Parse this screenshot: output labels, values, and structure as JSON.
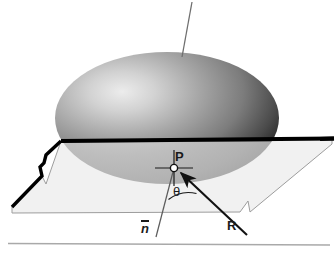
{
  "figure": {
    "background_color": "#ffffff",
    "width": 335,
    "height": 253
  },
  "labels": {
    "point_P": "P",
    "angle_theta": "θ",
    "vector_R": "R",
    "vector_n": "n"
  },
  "colors": {
    "sphere_highlight": "#e8e8e8",
    "sphere_mid": "#8f8f8f",
    "sphere_dark": "#1e1e1e",
    "sphere_below_plane": "#b4b4b4",
    "plane_fill": "#f0f0f0",
    "plane_outline": "#9a9a9a",
    "edge_thick": "#000000",
    "line_thin": "#6e6e6e",
    "rule_line": "#a8a8a8",
    "label_color": "#1a1a1a"
  },
  "geometry": {
    "sphere": {
      "center_x": 167,
      "center_y": 118,
      "radius_x": 112,
      "radius_y": 66,
      "highlight_x": 118,
      "highlight_y": 92
    },
    "plane": {
      "points": "61,141 332,139 332,144 250,212 248,201 240,212 12,213 12,206 42,176 46,184"
    },
    "intersection_edge": {
      "from_x": 61,
      "from_y": 141,
      "to_x": 334,
      "to_y": 139
    },
    "point_P": {
      "x": 174,
      "y": 168,
      "radius": 3.6
    },
    "normal_vector": {
      "from_x": 174,
      "from_y": 168,
      "to_x": 156,
      "to_y": 238
    },
    "reflection_vector": {
      "from_x": 246,
      "from_y": 234,
      "to_x": 180,
      "to_y": 172
    },
    "upper_thin_line": {
      "from_x": 192,
      "from_y": 2,
      "to_x": 182,
      "to_y": 57
    },
    "angle_arc": {
      "cx": 174,
      "cy": 168,
      "radius": 33,
      "start_deg": 75,
      "end_deg": 43
    },
    "bottom_rule": {
      "x1": 8,
      "y1": 243,
      "x2": 330,
      "y2": 245
    }
  }
}
